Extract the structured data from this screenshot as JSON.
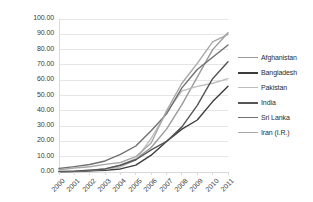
{
  "chart_data": {
    "type": "line",
    "title": "",
    "xlabel": "",
    "ylabel": "",
    "x": [
      2000,
      2001,
      2002,
      2003,
      2004,
      2005,
      2006,
      2007,
      2008,
      2009,
      2010,
      2011
    ],
    "categories": [
      "2000",
      "2001",
      "2002",
      "2003",
      "2004",
      "2005",
      "2006",
      "2007",
      "2008",
      "2009",
      "2010",
      "2011"
    ],
    "ylim": [
      0,
      100
    ],
    "yticks": [
      0,
      10,
      20,
      30,
      40,
      50,
      60,
      70,
      80,
      90,
      100
    ],
    "ytick_labels": [
      "0.00",
      "10.00",
      "20.00",
      "30.00",
      "40.00",
      "50.00",
      "60.00",
      "70.00",
      "80.00",
      "90.00",
      "100.00"
    ],
    "grid": true,
    "legend_position": "right",
    "series": [
      {
        "name": "Afghanistan",
        "color": "#9a9a9a",
        "values": [
          0.0,
          0.2,
          0.8,
          2.0,
          4.5,
          8.5,
          16.0,
          28.0,
          44.0,
          62.0,
          80.0,
          91.0
        ]
      },
      {
        "name": "Bangladesh",
        "color": "#3c3c3c",
        "values": [
          0.2,
          0.4,
          0.8,
          1.1,
          2.0,
          4.5,
          11.0,
          20.0,
          28.0,
          34.0,
          46.0,
          56.0
        ]
      },
      {
        "name": "Pakistan",
        "color": "#bdbdbd",
        "values": [
          0.2,
          0.6,
          1.2,
          1.8,
          3.3,
          8.0,
          22.0,
          39.0,
          53.0,
          56.0,
          58.0,
          61.0
        ]
      },
      {
        "name": "India",
        "color": "#555555",
        "values": [
          0.4,
          0.6,
          1.2,
          2.0,
          4.4,
          8.0,
          14.5,
          20.0,
          29.5,
          43.5,
          61.0,
          72.0
        ]
      },
      {
        "name": "Sri Lanka",
        "color": "#707070",
        "values": [
          2.3,
          3.5,
          4.9,
          7.2,
          11.5,
          17.0,
          27.0,
          38.0,
          55.0,
          67.0,
          75.0,
          83.0
        ]
      },
      {
        "name": "Iran (I.R.)",
        "color": "#a8a8a8",
        "values": [
          1.5,
          2.6,
          3.4,
          5.0,
          6.2,
          10.0,
          19.0,
          40.0,
          58.0,
          71.0,
          85.0,
          90.0
        ]
      }
    ]
  },
  "legend": {
    "items": [
      {
        "label": "Afghanistan"
      },
      {
        "label": "Bangladesh"
      },
      {
        "label": "Pakistan"
      },
      {
        "label": "India"
      },
      {
        "label": "Sri Lanka"
      },
      {
        "label": "Iran (I.R.)"
      }
    ]
  },
  "colors": {
    "plot_border": "#d9d9d9",
    "gridline": "#e6e6e6",
    "axis_text": "#3a3a3a",
    "background": "#ffffff"
  }
}
